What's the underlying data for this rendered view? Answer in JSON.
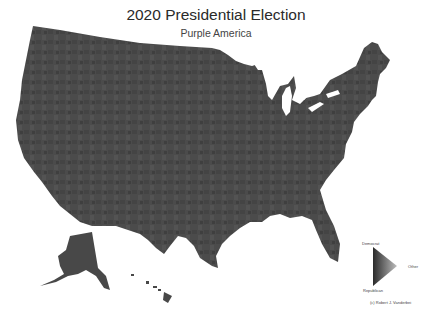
{
  "header": {
    "title": "2020 Presidential Election",
    "subtitle": "Purple America"
  },
  "map": {
    "region": "United States (counties)",
    "fill_color": "#4b4b4b",
    "fill_dark": "#3a3a3a",
    "fill_light": "#5a5a5a",
    "background": "#ffffff"
  },
  "legend": {
    "top_label": "Democrat",
    "right_label": "Other",
    "bottom_label": "Republican",
    "credit": "(c) Robert J. Vanderbei"
  }
}
